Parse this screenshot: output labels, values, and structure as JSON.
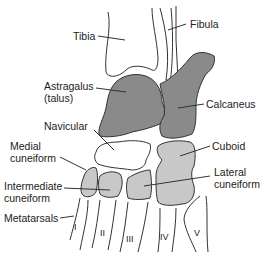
{
  "figure": {
    "colors": {
      "talus_calcaneus_fill": "#8a8a8a",
      "cuneiform_cuboid_fill": "#c8c8c8",
      "outline": "#333333",
      "background": "#ffffff"
    }
  },
  "labels": {
    "tibia": "Tibia",
    "fibula": "Fibula",
    "astragalus_line1": "Astragalus",
    "astragalus_line2": "(talus)",
    "calcaneus": "Calcaneus",
    "navicular": "Navicular",
    "medial_cuneiform_line1": "Medial",
    "medial_cuneiform_line2": "cuneiform",
    "cuboid": "Cuboid",
    "intermediate_cuneiform_line1": "Intermediate",
    "intermediate_cuneiform_line2": "cuneiform",
    "lateral_cuneiform_line1": "Lateral",
    "lateral_cuneiform_line2": "cuneiform",
    "metatarsals": "Metatarsals"
  },
  "metatarsal_numerals": [
    "I",
    "II",
    "III",
    "IV",
    "V"
  ]
}
